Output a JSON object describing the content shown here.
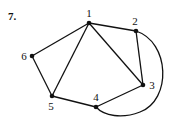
{
  "problem_number": "7.",
  "graph": {
    "nodes": [
      {
        "id": "1",
        "label": "1",
        "x": 89,
        "y": 23,
        "lx": 89,
        "ly": 17
      },
      {
        "id": "2",
        "label": "2",
        "x": 136,
        "y": 31,
        "lx": 135,
        "ly": 25
      },
      {
        "id": "3",
        "label": "3",
        "x": 143,
        "y": 85,
        "lx": 152,
        "ly": 89
      },
      {
        "id": "4",
        "label": "4",
        "x": 96,
        "y": 107,
        "lx": 96,
        "ly": 101
      },
      {
        "id": "5",
        "label": "5",
        "x": 52,
        "y": 96,
        "lx": 51,
        "ly": 110
      },
      {
        "id": "6",
        "label": "6",
        "x": 32,
        "y": 56,
        "lx": 24,
        "ly": 60
      }
    ],
    "edges": [
      {
        "from": "1",
        "to": "2"
      },
      {
        "from": "1",
        "to": "6"
      },
      {
        "from": "1",
        "to": "5"
      },
      {
        "from": "1",
        "to": "3"
      },
      {
        "from": "2",
        "to": "3"
      },
      {
        "from": "6",
        "to": "5"
      },
      {
        "from": "5",
        "to": "4"
      },
      {
        "from": "4",
        "to": "3"
      },
      {
        "from": "2",
        "to": "4",
        "curved": true
      }
    ]
  }
}
